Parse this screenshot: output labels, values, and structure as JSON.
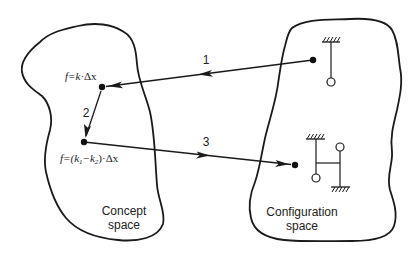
{
  "diagram": {
    "type": "concept-to-configuration mapping",
    "regions": [
      {
        "id": "concept",
        "label_line1": "Concept",
        "label_line2": "space"
      },
      {
        "id": "configuration",
        "label_line1": "Configuration",
        "label_line2": "space"
      }
    ],
    "points": [
      {
        "id": "concept_point_1",
        "region": "concept",
        "formula_prefix": "f=k",
        "formula_suffix": "·Δx"
      },
      {
        "id": "concept_point_2",
        "region": "concept",
        "formula_prefix": "f=(k",
        "sub1": "1",
        "minus": "−k",
        "sub2": "2",
        "formula_suffix": ")·Δx"
      },
      {
        "id": "config_point_single",
        "region": "configuration",
        "mechanism": "single pendulum"
      },
      {
        "id": "config_point_double",
        "region": "configuration",
        "mechanism": "coupled double pendulum"
      }
    ],
    "arrows": [
      {
        "label": "1",
        "from": "config_point_single",
        "to": "concept_point_1"
      },
      {
        "label": "2",
        "from": "concept_point_1",
        "to": "concept_point_2"
      },
      {
        "label": "3",
        "from": "concept_point_2",
        "to": "config_point_double"
      }
    ],
    "colors": {
      "stroke": "#1a1a1a",
      "background": "#ffffff"
    }
  }
}
